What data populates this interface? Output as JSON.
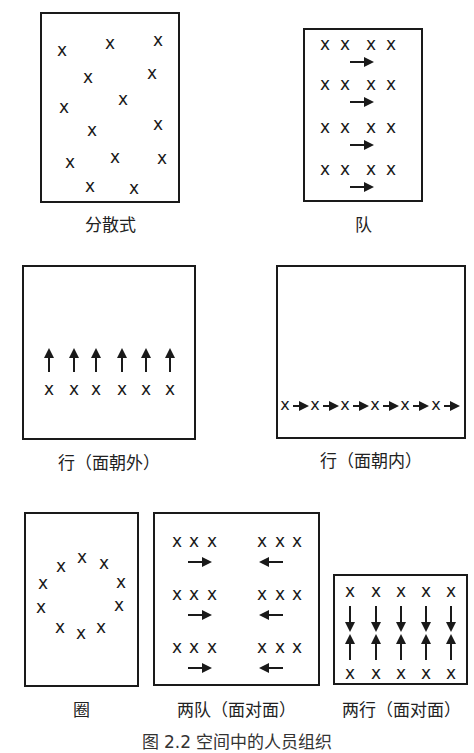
{
  "figure": {
    "caption": "图 2.2  空间中的人员组织",
    "person_symbol": "x",
    "panels": [
      {
        "id": "scattered",
        "label": "分散式",
        "box": [
          40,
          12,
          140,
          191
        ]
      },
      {
        "id": "queue",
        "label": "队",
        "box": [
          303,
          28,
          120,
          174
        ]
      },
      {
        "id": "row-facing-out",
        "label": "行（面朝外）",
        "box": [
          22,
          265,
          174,
          175
        ]
      },
      {
        "id": "row-facing-in",
        "label": "行（面朝内）",
        "box": [
          276,
          265,
          190,
          174
        ]
      },
      {
        "id": "circle",
        "label": "圈",
        "box": [
          24,
          512,
          115,
          175
        ]
      },
      {
        "id": "two-queues-facing",
        "label": "两队（面对面）",
        "box": [
          153,
          512,
          167,
          174
        ]
      },
      {
        "id": "two-rows-facing",
        "label": "两行（面对面）",
        "box": [
          333,
          574,
          135,
          111
        ]
      }
    ]
  },
  "chart_data": {
    "type": "diagram",
    "title": "图 2.2 空间中的人员组织",
    "panels": [
      {
        "label": "分散式",
        "people": 14,
        "arrangement": "scattered",
        "arrows": 0
      },
      {
        "label": "队",
        "people": 16,
        "arrangement": "4 rows x 4, facing right",
        "arrows": 4,
        "arrow_direction": "right"
      },
      {
        "label": "行（面朝外）",
        "people": 6,
        "arrangement": "single row",
        "arrows": 6,
        "arrow_direction": "up"
      },
      {
        "label": "行（面朝内）",
        "people": 6,
        "arrangement": "single line",
        "arrows": 6,
        "arrow_direction": "right"
      },
      {
        "label": "圈",
        "people": 10,
        "arrangement": "circle",
        "arrows": 0
      },
      {
        "label": "两队（面对面）",
        "people": 18,
        "arrangement": "2 groups x 3 rows x 3",
        "arrows": 6,
        "arrow_direction": "left group right, right group left"
      },
      {
        "label": "两行（面对面）",
        "people": 10,
        "arrangement": "2 rows x 5",
        "arrows": 10,
        "arrow_direction": "top row down, bottom row up"
      }
    ]
  }
}
